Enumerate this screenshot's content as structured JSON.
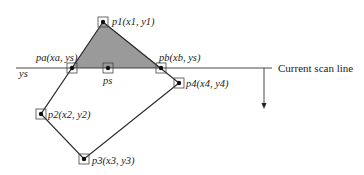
{
  "figure": {
    "type": "scan-line polygon fill",
    "fill_color": "#9a9a9a",
    "line_color": "#2a2a2a"
  },
  "vertices": [
    {
      "id": "p1",
      "label": "p1(x1, y1)",
      "x": 103,
      "y": 22
    },
    {
      "id": "p2",
      "label": "p2(x2, y2)",
      "x": 41,
      "y": 114
    },
    {
      "id": "p3",
      "label": "p3(x3, y3)",
      "x": 84,
      "y": 159
    },
    {
      "id": "p4",
      "label": "p4(x4, y4)",
      "x": 179,
      "y": 83
    }
  ],
  "intersections": [
    {
      "id": "pa",
      "label": "pa(xa, ys)",
      "x": 72,
      "y": 68
    },
    {
      "id": "pb",
      "label": "pb(xb, ys)",
      "x": 161,
      "y": 68
    },
    {
      "id": "ps",
      "label": "ps",
      "x": 108,
      "y": 68
    }
  ],
  "scan_line": {
    "y_label": "ys",
    "caption": "Current scan line",
    "x_start": 16,
    "x_end": 272,
    "y": 68
  },
  "direction_arrow": {
    "x": 264,
    "y_from": 68,
    "y_to": 108
  }
}
